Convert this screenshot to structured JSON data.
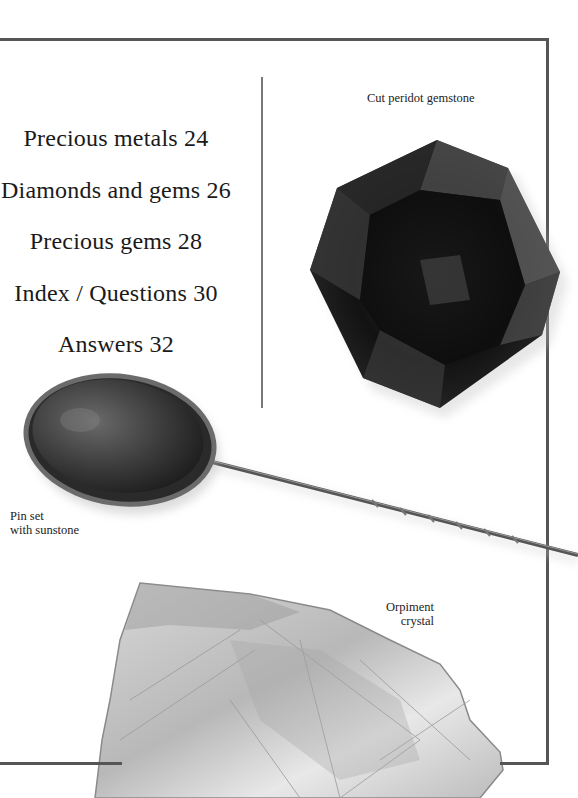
{
  "contents": {
    "items": [
      {
        "label": "Precious metals 24"
      },
      {
        "label": "Diamonds and gems 26"
      },
      {
        "label": "Precious gems 28"
      },
      {
        "label": "Index / Questions 30"
      },
      {
        "label": "Answers 32"
      }
    ]
  },
  "images": {
    "peridot": {
      "caption": "Cut peridot gemstone",
      "icon": "octagon-gem"
    },
    "pin": {
      "caption_line1": "Pin set",
      "caption_line2": "with sunstone",
      "icon": "oval-pin"
    },
    "orpiment": {
      "caption_line1": "Orpiment",
      "caption_line2": "crystal",
      "icon": "crystal-rock"
    }
  },
  "colors": {
    "frame": "#555555",
    "divider": "#777777",
    "text": "#1a1a1a"
  }
}
